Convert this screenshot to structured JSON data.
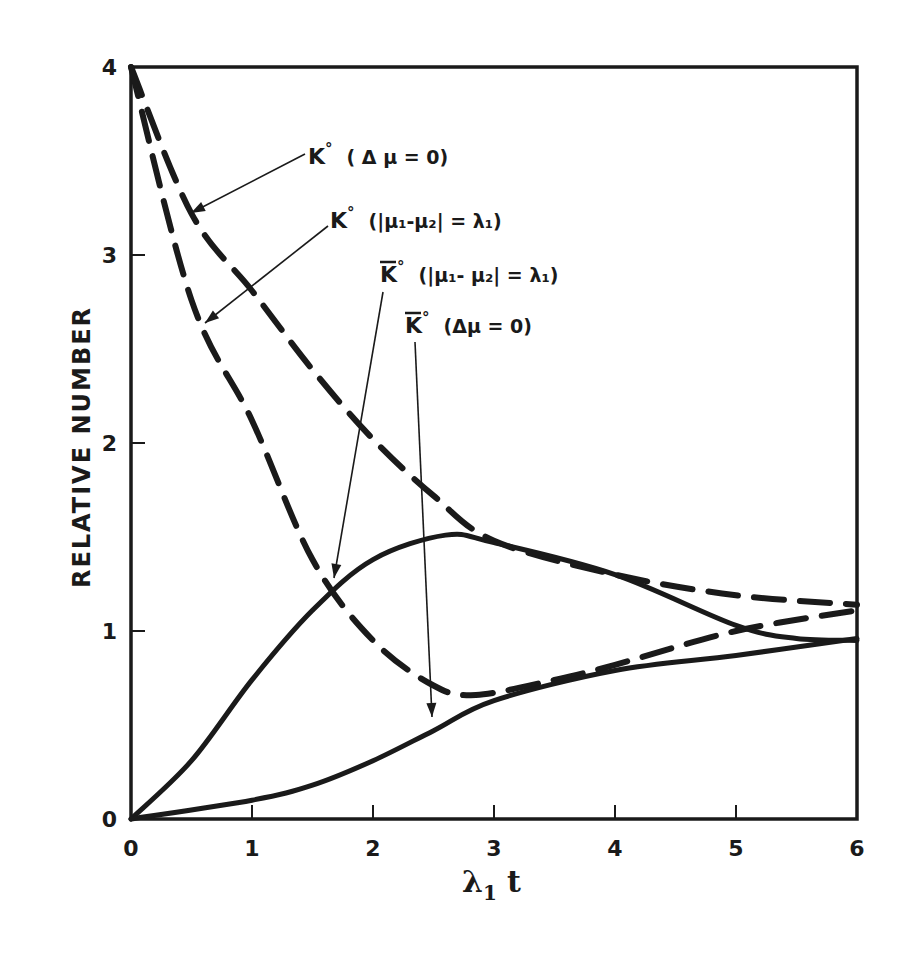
{
  "chart_data": {
    "type": "line",
    "title": "",
    "xlabel": "λ1 t",
    "ylabel": "RELATIVE NUMBER",
    "xlim": [
      0,
      6
    ],
    "ylim": [
      0,
      4
    ],
    "grid": false,
    "legend": "inline annotations with arrows",
    "x_ticks": [
      "0",
      "1",
      "2",
      "3",
      "4",
      "5",
      "6"
    ],
    "y_ticks": [
      "0",
      "1",
      "2",
      "3",
      "4"
    ],
    "series": [
      {
        "name": "K° (Δμ = 0)",
        "style": "dashed",
        "x": [
          0,
          0.5,
          1,
          1.5,
          2,
          2.5,
          3,
          4,
          5,
          6
        ],
        "values": [
          4.0,
          3.22,
          2.81,
          2.39,
          2.02,
          1.72,
          1.48,
          1.3,
          1.19,
          1.14
        ]
      },
      {
        "name": "K° (|μ1-μ2| = λ1)",
        "style": "dashed",
        "x": [
          0,
          0.5,
          1,
          1.5,
          2,
          2.5,
          2.85,
          3.5,
          4,
          5,
          6
        ],
        "values": [
          4.0,
          2.76,
          2.12,
          1.38,
          0.95,
          0.71,
          0.66,
          0.74,
          0.82,
          1.0,
          1.11
        ]
      },
      {
        "name": "K̄° (|μ1-μ2| = λ1)",
        "style": "solid",
        "x": [
          0,
          0.5,
          1,
          1.5,
          2,
          2.6,
          3,
          4,
          5,
          5.5,
          6
        ],
        "values": [
          0,
          0.31,
          0.74,
          1.11,
          1.38,
          1.51,
          1.47,
          1.3,
          1.03,
          0.96,
          0.95
        ]
      },
      {
        "name": "K̄° (Δμ = 0)",
        "style": "solid",
        "x": [
          0,
          1,
          1.5,
          2,
          2.5,
          3,
          4,
          5,
          6
        ],
        "values": [
          0,
          0.1,
          0.18,
          0.31,
          0.47,
          0.63,
          0.79,
          0.87,
          0.96
        ]
      }
    ],
    "annotations": [
      {
        "text_main": "K°",
        "text_cond": "( Δ μ = 0)",
        "bar": false,
        "points_to": "K° (Δμ = 0)"
      },
      {
        "text_main": "K°",
        "text_cond": "(|μ₁-μ₂| = λ₁)",
        "bar": false,
        "points_to": "K° (|μ1-μ2| = λ1)"
      },
      {
        "text_main": "K°",
        "text_cond": "(|μ₁- μ₂| = λ₁)",
        "bar": true,
        "points_to": "K̄° (|μ1-μ2| = λ1)"
      },
      {
        "text_main": "K°",
        "text_cond": "(Δμ = 0)",
        "bar": true,
        "points_to": "K̄° (Δμ = 0)"
      }
    ]
  },
  "axes": {
    "ylabel": "RELATIVE NUMBER",
    "xlabel_main": "λ",
    "xlabel_sub": "1",
    "xlabel_var": "t"
  },
  "colors": {
    "ink": "#1a1a1a",
    "background": "#ffffff"
  }
}
